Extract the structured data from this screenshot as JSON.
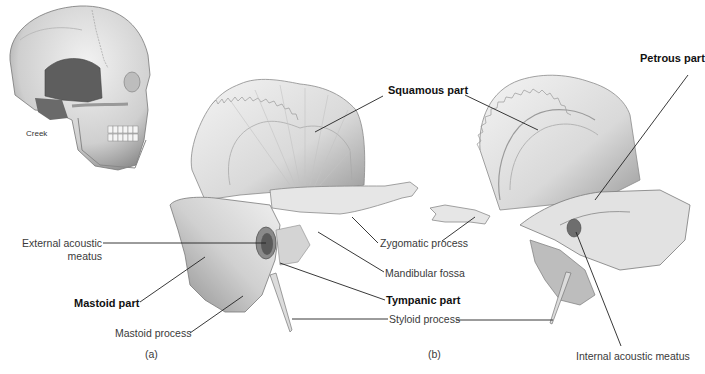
{
  "figure": {
    "skull_credit": "Creek",
    "panel_a_caption": "(a)",
    "panel_b_caption": "(b)"
  },
  "labels": {
    "squamous_part": "Squamous part",
    "petrous_part": "Petrous part",
    "external_acoustic_meatus_line1": "External acoustic",
    "external_acoustic_meatus_line2": "meatus",
    "mastoid_part": "Mastoid part",
    "mastoid_process": "Mastoid process",
    "zygomatic_process": "Zygomatic process",
    "mandibular_fossa": "Mandibular fossa",
    "tympanic_part": "Tympanic part",
    "styloid_process": "Styloid process",
    "internal_acoustic_meatus": "Internal acoustic meatus"
  },
  "colors": {
    "bone_light": "#ececec",
    "bone_mid": "#c8c8c8",
    "bone_dark": "#8a8a8a",
    "temporal_highlight": "#5e5e5e",
    "leader_line": "#222222"
  }
}
